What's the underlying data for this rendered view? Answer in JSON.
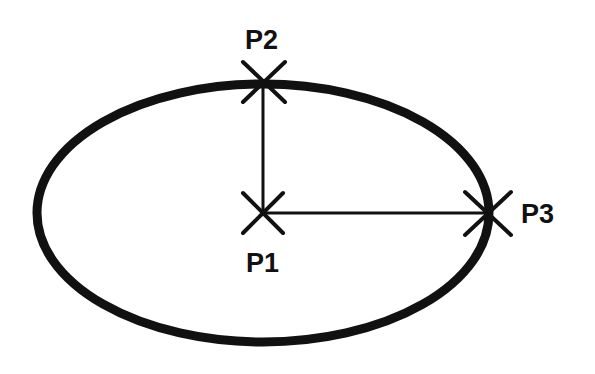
{
  "diagram": {
    "type": "ellipse-by-center-and-axis-endpoints",
    "colors": {
      "stroke": "#111111",
      "background": "#ffffff"
    },
    "ellipse": {
      "cx": 263,
      "cy": 213,
      "rx": 226,
      "ry": 129
    },
    "points": [
      {
        "id": "p1",
        "label": "P1",
        "x": 263,
        "y": 213
      },
      {
        "id": "p2",
        "label": "P2",
        "x": 263,
        "y": 84
      },
      {
        "id": "p3",
        "label": "P3",
        "x": 487,
        "y": 213
      }
    ]
  }
}
